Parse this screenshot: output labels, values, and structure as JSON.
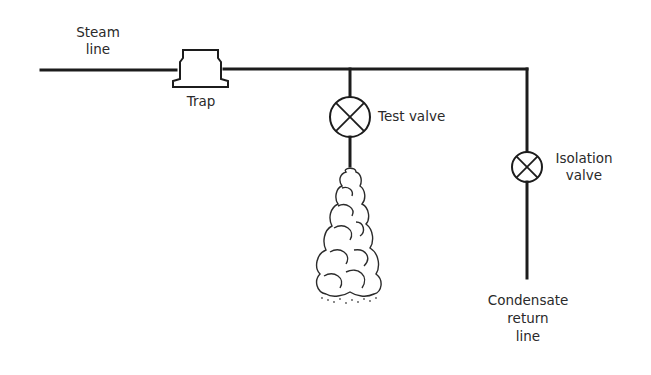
{
  "diagram": {
    "labels": {
      "steam_line": [
        "Steam",
        "line"
      ],
      "trap": "Trap",
      "test_valve": "Test valve",
      "isolation_valve": [
        "Isolation",
        "valve"
      ],
      "condensate_return_line": [
        "Condensate",
        "return",
        "line"
      ]
    },
    "components": [
      {
        "id": "steam-line",
        "type": "pipe",
        "label": "Steam line"
      },
      {
        "id": "trap",
        "type": "steam-trap",
        "label": "Trap"
      },
      {
        "id": "test-valve",
        "type": "valve",
        "label": "Test valve"
      },
      {
        "id": "steam-discharge",
        "type": "plume",
        "label": ""
      },
      {
        "id": "isolation-valve",
        "type": "valve",
        "label": "Isolation valve"
      },
      {
        "id": "condensate-return-line",
        "type": "pipe",
        "label": "Condensate return line"
      }
    ],
    "connections": [
      [
        "steam-line",
        "trap"
      ],
      [
        "trap",
        "test-valve"
      ],
      [
        "test-valve",
        "steam-discharge"
      ],
      [
        "trap",
        "isolation-valve"
      ],
      [
        "isolation-valve",
        "condensate-return-line"
      ]
    ],
    "colors": {
      "line": "#1c1c1c",
      "text": "#2a2a2a",
      "background": "#ffffff"
    }
  }
}
